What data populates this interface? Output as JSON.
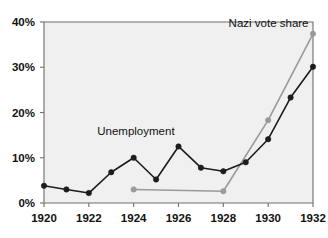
{
  "chart_data": {
    "type": "line",
    "title": "",
    "subtitle": "",
    "xlabel": "",
    "ylabel": "",
    "xlim": [
      1920,
      1932
    ],
    "ylim": [
      0,
      40
    ],
    "grid": false,
    "legend_position": "inline-annotation",
    "x_tick_labels": [
      "1920",
      "1922",
      "1924",
      "1926",
      "1928",
      "1930",
      "1932"
    ],
    "x_ticks": [
      1920,
      1922,
      1924,
      1926,
      1928,
      1930,
      1932
    ],
    "y_tick_labels": [
      "0%",
      "10%",
      "20%",
      "30%",
      "40%"
    ],
    "y_ticks": [
      0,
      10,
      20,
      30,
      40
    ],
    "series": [
      {
        "name": "Unemployment",
        "color": "#1c1c1c",
        "marker": "circle",
        "x": [
          1920,
          1921,
          1922,
          1923,
          1924,
          1925,
          1926,
          1927,
          1928,
          1929,
          1930,
          1931,
          1932
        ],
        "values": [
          3.8,
          3.0,
          2.2,
          6.8,
          10.0,
          5.2,
          12.5,
          7.8,
          7.0,
          9.0,
          14.1,
          23.3,
          30.1
        ]
      },
      {
        "name": "Nazi vote share",
        "color": "#9a9a9a",
        "marker": "circle",
        "x": [
          1924,
          1928,
          1930,
          1932
        ],
        "values": [
          3.0,
          2.6,
          18.3,
          37.4
        ]
      }
    ],
    "annotations": [
      {
        "text": "Unemployment",
        "x": 1924.1,
        "y": 15.0,
        "anchor": "middle"
      },
      {
        "text": "Nazi vote share",
        "x": 1931.8,
        "y": 38.9,
        "anchor": "end"
      }
    ],
    "colors": {
      "plot_background": "#f0f0f0",
      "page_background": "#ffffff",
      "axis": "#6e6e6e",
      "text": "#111111",
      "unemployment_series": "#1c1c1c",
      "nazi_series": "#9a9a9a"
    }
  }
}
